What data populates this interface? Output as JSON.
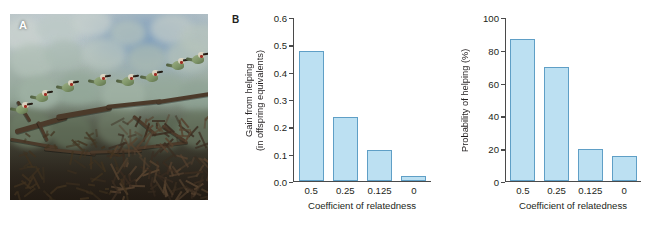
{
  "figure": {
    "panels": [
      {
        "label": "A",
        "kind": "photograph"
      },
      {
        "label": "B",
        "kind": "chart"
      }
    ]
  },
  "panel_a": {
    "label": "A",
    "alt": "A row of white-fronted bee-eaters perched on a thorny branch against pale green foliage and blue sky"
  },
  "panel_b": {
    "label": "B"
  },
  "chart_data": [
    {
      "type": "bar",
      "panel": "B",
      "title": "",
      "categories": [
        "0.5",
        "0.25",
        "0.125",
        "0"
      ],
      "values": [
        0.48,
        0.235,
        0.113,
        0.02
      ],
      "xlabel": "Coefficient of relatedness",
      "ylabel": "Gain from helping\n(in offspring equivalents)",
      "ylim": [
        0.0,
        0.6
      ],
      "yticks": [
        "0.0",
        "0.1",
        "0.2",
        "0.3",
        "0.4",
        "0.5",
        "0.6"
      ],
      "ytick_values": [
        0.0,
        0.1,
        0.2,
        0.3,
        0.4,
        0.5,
        0.6
      ],
      "grid": false,
      "legend": "none",
      "bar_fill": "#bce0f2",
      "bar_stroke": "#5f9fc6"
    },
    {
      "type": "bar",
      "panel": "B-right",
      "title": "",
      "categories": [
        "0.5",
        "0.25",
        "0.125",
        "0"
      ],
      "values": [
        87,
        70,
        19.5,
        15.5
      ],
      "xlabel": "Coefficient of relatedness",
      "ylabel": "Probability of helping (%)",
      "ylim": [
        0,
        100
      ],
      "yticks": [
        "0",
        "20",
        "40",
        "60",
        "80",
        "100"
      ],
      "ytick_values": [
        0,
        20,
        40,
        60,
        80,
        100
      ],
      "grid": false,
      "legend": "none",
      "bar_fill": "#bce0f2",
      "bar_stroke": "#5f9fc6"
    }
  ]
}
